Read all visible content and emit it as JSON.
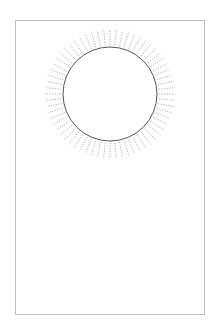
{
  "figure": {
    "frame": {
      "x": 15,
      "y": 20,
      "width": 190,
      "height": 295,
      "border_color": "#bdbdbd"
    },
    "circle": {
      "cx": 110,
      "cy": 94,
      "r": 47,
      "stroke": "#555555",
      "stroke_width": 1
    },
    "radial_ticks": {
      "count": 64,
      "inner_r": 49,
      "outer_r": 65,
      "stroke": "#9a9a9a",
      "dash": "1.2,1.4",
      "stroke_width": 0.8
    }
  }
}
